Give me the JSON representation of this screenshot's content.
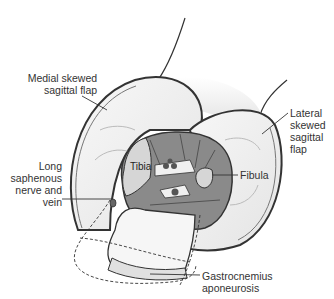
{
  "figure": {
    "type": "anatomical-illustration",
    "colors": {
      "outline": "#333333",
      "skin": "#f4f4f4",
      "muscle": "#8a8a8a",
      "bone": "#d6d6d6",
      "shadow": "#e2e2e2"
    }
  },
  "labels": {
    "medial_flap": [
      "Medial skewed",
      "sagittal flap"
    ],
    "lateral_flap": [
      "Lateral",
      "skewed",
      "sagittal",
      "flap"
    ],
    "saphenous": [
      "Long",
      "saphenous",
      "nerve and",
      "vein"
    ],
    "gastrocnemius": [
      "Gastrocnemius",
      "aponeurosis"
    ],
    "tibia": "Tibia",
    "fibula": "Fibula"
  }
}
